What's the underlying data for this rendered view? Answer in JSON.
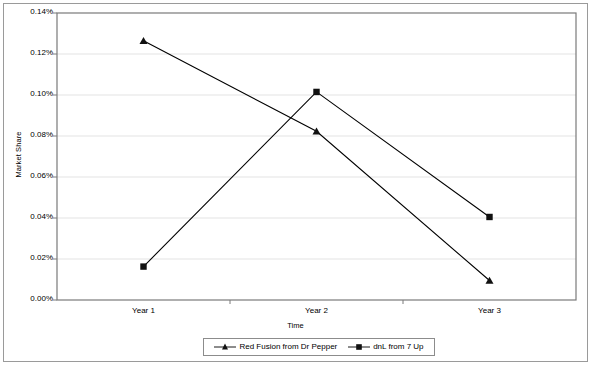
{
  "chart_data": {
    "type": "line",
    "title": "",
    "xlabel": "Time",
    "ylabel": "Market Share",
    "categories": [
      "Year 1",
      "Year 2",
      "Year 3"
    ],
    "ylim": [
      0,
      0.0014
    ],
    "ytick_labels": [
      "0.14%",
      "0.12%",
      "0.10%",
      "0.08%",
      "0.06%",
      "0.04%",
      "0.02%",
      "0.00%"
    ],
    "ytick_values": [
      0.0014,
      0.0012,
      0.001,
      0.0008,
      0.0006,
      0.0004,
      0.0002,
      0.0
    ],
    "grid": true,
    "legend_position": "bottom",
    "series": [
      {
        "name": "Red Fusion from Dr Pepper",
        "marker": "triangle",
        "color": "#000000",
        "values": [
          0.001265,
          0.000823,
          9.5e-05
        ],
        "value_labels": [
          "0.1265%",
          "0.0823%",
          "0.0095%"
        ]
      },
      {
        "name": "dnL from 7 Up",
        "marker": "square",
        "color": "#000000",
        "values": [
          0.000163,
          0.001015,
          0.000405
        ],
        "value_labels": [
          "0.0163%",
          "0.1015%",
          "0.0405%"
        ]
      }
    ]
  },
  "axes": {
    "y_title": "Market Share",
    "x_title": "Time"
  },
  "legend": {
    "entries": [
      {
        "label": "Red Fusion from Dr Pepper",
        "marker": "triangle-marker"
      },
      {
        "label": "dnL from 7 Up",
        "marker": "square-marker"
      }
    ]
  },
  "colors": {
    "plot_border": "#7a7a7a",
    "frame_border": "#9a9a9a",
    "gridline": "#e3e3e3",
    "series_line": "#1a1a1a",
    "background": "#ffffff"
  }
}
